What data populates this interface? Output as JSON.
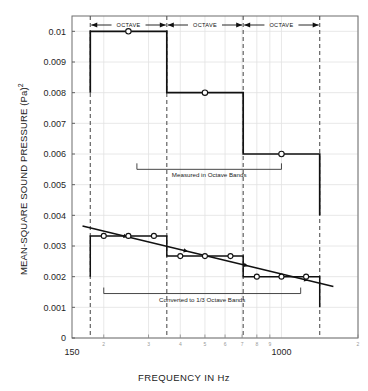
{
  "chart_data": {
    "type": "line",
    "title": "",
    "xlabel": "FREQUENCY IN Hz",
    "ylabel": "MEAN-SQUARE SOUND PRESSURE (Pa)",
    "ylabel_exponent": "2",
    "xscale": "log",
    "xlim": [
      150,
      2000
    ],
    "ylim": [
      0,
      0.0105
    ],
    "grid": true,
    "x_major_ticks": [
      {
        "value": 150,
        "label": "150"
      },
      {
        "value": 1000,
        "label": "1000"
      }
    ],
    "x_minor_ticks": [
      {
        "value": 200,
        "label": "2"
      },
      {
        "value": 300,
        "label": "3"
      },
      {
        "value": 400,
        "label": "4"
      },
      {
        "value": 500,
        "label": "5"
      },
      {
        "value": 600,
        "label": "6"
      },
      {
        "value": 700,
        "label": "7"
      },
      {
        "value": 800,
        "label": "8"
      },
      {
        "value": 900,
        "label": "9"
      },
      {
        "value": 2000,
        "label": "2"
      }
    ],
    "y_ticks": [
      {
        "value": 0,
        "label": "0"
      },
      {
        "value": 0.001,
        "label": "0.001"
      },
      {
        "value": 0.002,
        "label": "0.002"
      },
      {
        "value": 0.003,
        "label": "0.003"
      },
      {
        "value": 0.004,
        "label": "0.004"
      },
      {
        "value": 0.005,
        "label": "0.005"
      },
      {
        "value": 0.006,
        "label": "0.006"
      },
      {
        "value": 0.007,
        "label": "0.007"
      },
      {
        "value": 0.008,
        "label": "0.008"
      },
      {
        "value": 0.009,
        "label": "0.009"
      },
      {
        "value": 0.01,
        "label": "0.01"
      }
    ],
    "octave_band_edges": [
      177,
      354,
      707,
      1414
    ],
    "series": [
      {
        "name": "Measured in Octave Bands",
        "style": "step",
        "bands": [
          {
            "f_low": 177,
            "f_high": 354,
            "f_center": 250,
            "value": 0.01
          },
          {
            "f_low": 354,
            "f_high": 707,
            "f_center": 500,
            "value": 0.008
          },
          {
            "f_low": 707,
            "f_high": 1414,
            "f_center": 1000,
            "value": 0.006
          }
        ],
        "start_value": 0.008,
        "end_value": 0.004
      },
      {
        "name": "Converted to 1/3 Octave Bands",
        "style": "step",
        "bands": [
          {
            "f_low": 177,
            "f_high": 354,
            "f_center": 200,
            "value": 0.00333
          },
          {
            "f_low": 177,
            "f_high": 354,
            "f_center": 250,
            "value": 0.00333
          },
          {
            "f_low": 177,
            "f_high": 354,
            "f_center": 315,
            "value": 0.00333
          },
          {
            "f_low": 354,
            "f_high": 707,
            "f_center": 400,
            "value": 0.00267
          },
          {
            "f_low": 354,
            "f_high": 707,
            "f_center": 500,
            "value": 0.00267
          },
          {
            "f_low": 354,
            "f_high": 707,
            "f_center": 630,
            "value": 0.00267
          },
          {
            "f_low": 707,
            "f_high": 1414,
            "f_center": 800,
            "value": 0.002
          },
          {
            "f_low": 707,
            "f_high": 1414,
            "f_center": 1000,
            "value": 0.002
          },
          {
            "f_low": 707,
            "f_high": 1414,
            "f_center": 1250,
            "value": 0.002
          }
        ],
        "start_value": 0.002,
        "end_value": 0.001
      },
      {
        "name": "trend-line",
        "style": "line",
        "points": [
          {
            "f": 165,
            "value": 0.00365
          },
          {
            "f": 1600,
            "value": 0.00168
          }
        ]
      }
    ],
    "annotations": [
      {
        "name": "octave-span-1",
        "label": "OCTAVE",
        "f_low": 177,
        "f_high": 354
      },
      {
        "name": "octave-span-2",
        "label": "OCTAVE",
        "f_low": 354,
        "f_high": 707
      },
      {
        "name": "octave-span-3",
        "label": "OCTAVE",
        "f_low": 707,
        "f_high": 1414
      },
      {
        "name": "measured-bracket",
        "label": "Measured in Octave Bands",
        "f_low": 270,
        "f_high": 1000,
        "value": 0.0055
      },
      {
        "name": "converted-bracket",
        "label": "Converted to 1/3 Octave Bands",
        "f_low": 200,
        "f_high": 1190,
        "value": 0.00145
      }
    ],
    "colors": {
      "line": "#111111",
      "grid": "#e2e2e2",
      "band_divider": "#555555",
      "frame": "#6d6d6d",
      "marker_fill": "#ffffff"
    }
  }
}
